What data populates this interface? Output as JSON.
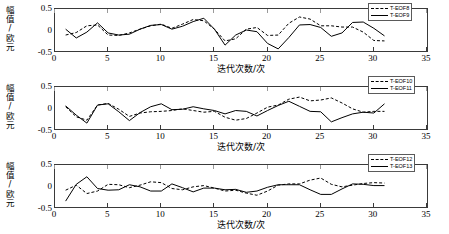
{
  "figure": {
    "panel_count": 3,
    "background": "#ffffff",
    "line_color": "#000000"
  },
  "axes": {
    "ylabel_chars": [
      "幅",
      "值",
      "/",
      "欧",
      "元"
    ],
    "ylabel_text": "幅值/欧元",
    "xlabel_text": "迭代次数/次",
    "yticks": [
      "0.5",
      "0",
      "-0.5"
    ],
    "xticks": [
      "0",
      "5",
      "10",
      "15",
      "20",
      "25",
      "30",
      "35"
    ],
    "xlim": [
      0,
      35
    ],
    "ylim": [
      -0.5,
      0.5
    ]
  },
  "panels": [
    {
      "legend": [
        {
          "label": "T-EOF8",
          "style": "dashed"
        },
        {
          "label": "T-EOF9",
          "style": "solid"
        }
      ]
    },
    {
      "legend": [
        {
          "label": "T-EOF10",
          "style": "dashed"
        },
        {
          "label": "T-EOF11",
          "style": "solid"
        }
      ]
    },
    {
      "legend": [
        {
          "label": "T-EOF12",
          "style": "dashed"
        },
        {
          "label": "T-EOF13",
          "style": "solid"
        }
      ]
    }
  ],
  "chart_data": [
    {
      "type": "line",
      "title": "",
      "xlabel": "迭代次数/次",
      "ylabel": "幅值/欧元",
      "xlim": [
        0,
        35
      ],
      "ylim": [
        -0.5,
        0.5
      ],
      "xticks": [
        0,
        5,
        10,
        15,
        20,
        25,
        30,
        35
      ],
      "yticks": [
        -0.5,
        0,
        0.5
      ],
      "grid": false,
      "legend_position": "top-right",
      "x": [
        1,
        2,
        3,
        4,
        5,
        6,
        7,
        8,
        9,
        10,
        11,
        12,
        13,
        14,
        15,
        16,
        17,
        18,
        19,
        20,
        21,
        22,
        23,
        24,
        25,
        26,
        27,
        28,
        29,
        30,
        31
      ],
      "series": [
        {
          "name": "T-EOF8",
          "style": "dashed",
          "values": [
            -0.12,
            -0.06,
            0.1,
            0.12,
            -0.12,
            -0.13,
            -0.07,
            0.02,
            0.1,
            0.14,
            0.04,
            0.14,
            0.25,
            0.22,
            0.02,
            -0.26,
            -0.21,
            0.02,
            0.06,
            -0.13,
            -0.12,
            0.16,
            0.31,
            0.26,
            0.1,
            0.1,
            0.07,
            0.07,
            -0.05,
            -0.25,
            -0.26
          ]
        },
        {
          "name": "T-EOF9",
          "style": "solid",
          "values": [
            0.02,
            -0.19,
            -0.05,
            0.17,
            -0.07,
            -0.12,
            -0.1,
            0.02,
            0.11,
            0.13,
            0.02,
            0.09,
            0.2,
            0.28,
            0.02,
            -0.36,
            -0.12,
            0.0,
            -0.04,
            -0.32,
            -0.45,
            -0.18,
            0.12,
            0.13,
            0.06,
            -0.15,
            -0.07,
            0.18,
            0.19,
            0.04,
            -0.14
          ]
        }
      ]
    },
    {
      "type": "line",
      "title": "",
      "xlabel": "迭代次数/次",
      "ylabel": "幅值/欧元",
      "xlim": [
        0,
        35
      ],
      "ylim": [
        -0.5,
        0.5
      ],
      "xticks": [
        0,
        5,
        10,
        15,
        20,
        25,
        30,
        35
      ],
      "yticks": [
        -0.5,
        0,
        0.5
      ],
      "grid": false,
      "legend_position": "top-right",
      "x": [
        1,
        2,
        3,
        4,
        5,
        6,
        7,
        8,
        9,
        10,
        11,
        12,
        13,
        14,
        15,
        16,
        17,
        18,
        19,
        20,
        21,
        22,
        23,
        24,
        25,
        26,
        27,
        28,
        29,
        30,
        31
      ],
      "series": [
        {
          "name": "T-EOF10",
          "style": "dashed",
          "values": [
            0.03,
            -0.21,
            -0.29,
            0.07,
            0.11,
            -0.03,
            -0.2,
            -0.12,
            -0.09,
            -0.08,
            -0.06,
            -0.02,
            -0.06,
            -0.1,
            -0.08,
            -0.22,
            -0.29,
            -0.25,
            -0.12,
            0.02,
            0.07,
            0.21,
            0.26,
            0.17,
            0.19,
            0.24,
            0.12,
            -0.02,
            -0.1,
            -0.08,
            -0.08
          ]
        },
        {
          "name": "T-EOF11",
          "style": "solid",
          "values": [
            0.05,
            -0.17,
            -0.36,
            0.07,
            0.1,
            -0.09,
            -0.3,
            -0.11,
            0.03,
            0.1,
            -0.04,
            -0.03,
            0.03,
            -0.02,
            -0.06,
            -0.14,
            -0.06,
            -0.08,
            -0.19,
            -0.06,
            0.06,
            0.16,
            0.04,
            -0.08,
            -0.09,
            -0.33,
            -0.23,
            -0.14,
            -0.1,
            -0.12,
            0.1
          ]
        }
      ]
    },
    {
      "type": "line",
      "title": "",
      "xlabel": "迭代次数/次",
      "ylabel": "幅值/欧元",
      "xlim": [
        0,
        35
      ],
      "ylim": [
        -0.5,
        0.5
      ],
      "xticks": [
        0,
        5,
        10,
        15,
        20,
        25,
        30,
        35
      ],
      "yticks": [
        -0.5,
        0,
        0.5
      ],
      "grid": false,
      "legend_position": "top-right",
      "x": [
        1,
        2,
        3,
        4,
        5,
        6,
        7,
        8,
        9,
        10,
        11,
        12,
        13,
        14,
        15,
        16,
        17,
        18,
        19,
        20,
        21,
        22,
        23,
        24,
        25,
        26,
        27,
        28,
        29,
        30,
        31
      ],
      "values_note": "",
      "series": [
        {
          "name": "T-EOF12",
          "style": "dashed",
          "values": [
            -0.1,
            0.02,
            -0.18,
            -0.12,
            0.04,
            0.03,
            -0.04,
            0.02,
            0.1,
            0.08,
            -0.06,
            -0.09,
            -0.02,
            0.01,
            -0.05,
            -0.12,
            -0.1,
            -0.17,
            -0.22,
            -0.12,
            0.02,
            0.05,
            0.05,
            0.14,
            0.19,
            0.04,
            -0.02,
            0.02,
            0.06,
            0.08,
            0.07
          ]
        },
        {
          "name": "T-EOF13",
          "style": "solid",
          "values": [
            -0.36,
            0.04,
            0.22,
            -0.06,
            -0.1,
            -0.09,
            0.03,
            -0.02,
            -0.12,
            -0.12,
            0.05,
            -0.04,
            -0.14,
            -0.05,
            -0.05,
            -0.09,
            -0.08,
            -0.15,
            -0.12,
            -0.03,
            0.03,
            0.03,
            0.03,
            -0.09,
            -0.2,
            -0.2,
            -0.07,
            0.05,
            0.04,
            0.01,
            0.01
          ]
        }
      ]
    }
  ]
}
